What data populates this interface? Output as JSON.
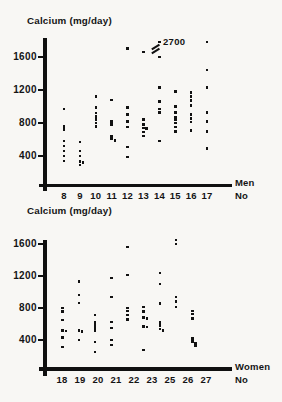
{
  "page": {
    "paper_color": "#f8f7f4",
    "ink_color": "#161616"
  },
  "chart_data": [
    {
      "id": "men",
      "type": "scatter",
      "title": "Calcium (mg/day)",
      "group_label": "Men",
      "axis_unit_label": "No",
      "ylabel": "Calcium (mg/day)",
      "y_ticks": [
        1600,
        1200,
        800,
        400
      ],
      "ylim": [
        0,
        1850
      ],
      "grid": false,
      "annotation": {
        "text": "2700",
        "applies_to_category": "14",
        "note_style": "axis-break"
      },
      "categories": [
        "8",
        "9",
        "10",
        "11",
        "12",
        "13",
        "14",
        "15",
        "16",
        "17"
      ],
      "series": [
        {
          "category": "8",
          "values": [
            970,
            760,
            720,
            580,
            520,
            460,
            400,
            340
          ]
        },
        {
          "category": "9",
          "values": [
            570,
            460,
            400,
            330,
            320,
            290
          ]
        },
        {
          "category": "10",
          "values": [
            1120,
            990,
            920,
            880,
            840,
            800,
            760
          ]
        },
        {
          "category": "11",
          "values": [
            1080,
            820,
            780,
            640,
            610,
            590
          ]
        },
        {
          "category": "12",
          "values": [
            1700,
            990,
            900,
            820,
            750,
            510,
            390
          ]
        },
        {
          "category": "13",
          "values": [
            1660,
            840,
            780,
            740,
            730,
            690,
            640
          ]
        },
        {
          "category": "14",
          "values": [
            2700,
            1600,
            1230,
            1060,
            970,
            930,
            580
          ]
        },
        {
          "category": "15",
          "values": [
            1180,
            1000,
            930,
            870,
            840,
            800,
            750,
            700
          ]
        },
        {
          "category": "16",
          "values": [
            1170,
            1120,
            1070,
            1010,
            900,
            855,
            810,
            710
          ]
        },
        {
          "category": "17",
          "values": [
            1790,
            1440,
            1230,
            930,
            820,
            700,
            490
          ]
        }
      ]
    },
    {
      "id": "women",
      "type": "scatter",
      "title": "Calcium (mg/day)",
      "group_label": "Women",
      "axis_unit_label": "No",
      "ylabel": "Calcium (mg/day)",
      "y_ticks": [
        1600,
        1200,
        800,
        400
      ],
      "ylim": [
        0,
        1650
      ],
      "grid": false,
      "categories": [
        "18",
        "19",
        "20",
        "21",
        "22",
        "23",
        "25",
        "26",
        "27"
      ],
      "series": [
        {
          "category": "18",
          "values": [
            800,
            755,
            650,
            520,
            510,
            430,
            310
          ]
        },
        {
          "category": "19",
          "values": [
            1130,
            960,
            860,
            520,
            505,
            400
          ]
        },
        {
          "category": "20",
          "values": [
            710,
            620,
            580,
            545,
            510,
            375,
            250
          ]
        },
        {
          "category": "21",
          "values": [
            1175,
            940,
            625,
            550,
            400,
            340
          ]
        },
        {
          "category": "22",
          "values": [
            1565,
            1210,
            800,
            760,
            715,
            655
          ]
        },
        {
          "category": "23",
          "values": [
            810,
            755,
            680,
            670,
            570,
            560,
            275
          ]
        },
        {
          "category": "25",
          "values": [
            1240,
            1100,
            855,
            620,
            580,
            535,
            520
          ]
        },
        {
          "category": "26",
          "values": [
            1650,
            1600,
            940,
            880,
            815
          ]
        },
        {
          "category": "27",
          "values": [
            760,
            725,
            670,
            420,
            380,
            355,
            330
          ]
        }
      ]
    }
  ]
}
